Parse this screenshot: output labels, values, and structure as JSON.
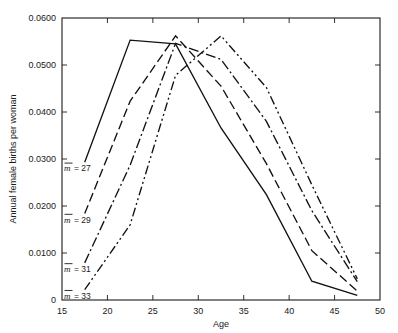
{
  "chart_data": {
    "type": "line",
    "title": "",
    "xlabel": "Age",
    "ylabel": "Annual female births per woman",
    "xlim": [
      15,
      50
    ],
    "ylim": [
      0,
      0.06
    ],
    "xticks": [
      15,
      20,
      25,
      30,
      35,
      40,
      45,
      50
    ],
    "xtick_labels": [
      "15",
      "20",
      "25",
      "30",
      "35",
      "40",
      "45",
      "50"
    ],
    "yticks": [
      0,
      0.01,
      0.02,
      0.03,
      0.04,
      0.05,
      0.06
    ],
    "ytick_labels": [
      "0",
      "0.0100",
      "0.0200",
      "0.0300",
      "0.0400",
      "0.0500",
      "0.0600"
    ],
    "grid": false,
    "legend": "inline-at-curve-start",
    "frame": "box-with-inward-ticks",
    "series": [
      {
        "name": "m = 27",
        "label_var": "m",
        "label_eq": " =  27",
        "label_value": 27,
        "style": "solid",
        "dasharray": "",
        "x": [
          17.5,
          22.5,
          27.5,
          32.5,
          37.5,
          42.5,
          47.5
        ],
        "values": [
          0.0293,
          0.0553,
          0.0545,
          0.0366,
          0.0224,
          0.004,
          0.001
        ]
      },
      {
        "name": "m = 29",
        "label_var": "m",
        "label_eq": " =  29",
        "label_value": 29,
        "style": "long-dash",
        "dasharray": "9,4",
        "x": [
          17.5,
          22.5,
          27.5,
          32.5,
          37.5,
          42.5,
          47.5
        ],
        "values": [
          0.0184,
          0.0423,
          0.0562,
          0.0455,
          0.029,
          0.0105,
          0.0019
        ]
      },
      {
        "name": "m = 31",
        "label_var": "m",
        "label_eq": " =  31",
        "label_value": 31,
        "style": "dash-dot",
        "dasharray": "10,3,2,3",
        "x": [
          17.5,
          22.5,
          27.5,
          32.5,
          37.5,
          42.5,
          47.5
        ],
        "values": [
          0.0079,
          0.0287,
          0.0546,
          0.0512,
          0.038,
          0.019,
          0.0039
        ]
      },
      {
        "name": "m = 33",
        "label_var": "m",
        "label_eq": " =  33",
        "label_value": 33,
        "style": "dash-dot-dot",
        "dasharray": "9,3,2,3,2,3",
        "x": [
          17.5,
          22.5,
          27.5,
          32.5,
          37.5,
          42.5,
          47.5
        ],
        "values": [
          0.0022,
          0.016,
          0.0478,
          0.0562,
          0.0452,
          0.0245,
          0.0045
        ]
      }
    ],
    "series_label_positions": [
      {
        "series": 0,
        "x": 17.5,
        "y": 0.0293
      },
      {
        "series": 1,
        "x": 17.5,
        "y": 0.0184
      },
      {
        "series": 2,
        "x": 17.5,
        "y": 0.0079
      },
      {
        "series": 3,
        "x": 17.5,
        "y": 0.0022
      }
    ]
  }
}
